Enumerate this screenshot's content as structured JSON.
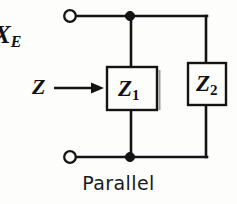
{
  "figure": {
    "caption": "Parallel",
    "background_color": "#fdfdfc",
    "ink_color": "#141414"
  },
  "labels": {
    "reactance": {
      "base": "X",
      "subscript": "E",
      "note": "partially cropped at left edge"
    },
    "source_impedance": {
      "symbol": "Z"
    }
  },
  "components": [
    {
      "name": "impedance-one",
      "base": "Z",
      "subscript": "1"
    },
    {
      "name": "impedance-two",
      "base": "Z",
      "subscript": "2"
    }
  ],
  "terminals": {
    "top": "open-terminal",
    "bottom": "open-terminal"
  },
  "icons": {
    "arrow": "arrow-right-icon",
    "open_terminal": "open-circle-terminal-icon",
    "junction": "junction-dot-icon"
  }
}
